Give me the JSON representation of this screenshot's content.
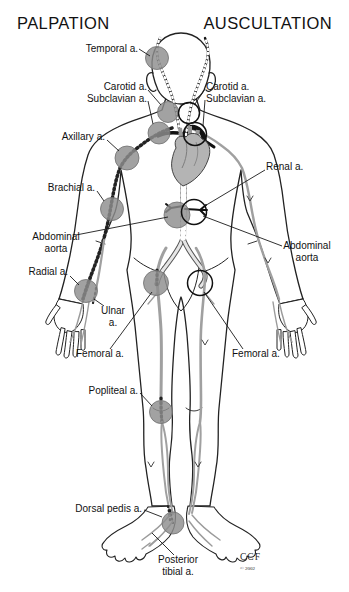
{
  "titles": {
    "left": "PALPATION",
    "right": "AUSCULTATION"
  },
  "labels": {
    "temporal": "Temporal a.",
    "carotid_left": "Carotid a.",
    "subclavian_left": "Subclavian a.",
    "carotid_right": "Carotid a.",
    "subclavian_right": "Subclavian a.",
    "axillary": "Axillary a.",
    "renal": "Renal a.",
    "brachial": "Brachial a.",
    "abdominal_aorta_left": "Abdominal\naorta",
    "abdominal_aorta_right": "Abdominal\naorta",
    "radial": "Radial a.",
    "ulnar": "Ulnar\na.",
    "femoral_left": "Femoral a.",
    "femoral_right": "Femoral a.",
    "popliteal": "Popliteal a.",
    "dorsal_pedis": "Dorsal pedis a.",
    "posterior_tibial": "Posterior\ntibial a."
  },
  "credit": {
    "org": "CCF",
    "year": "© 2002"
  },
  "markers": {
    "palpation_points": [
      "Temporal",
      "Carotid",
      "Subclavian",
      "Axillary",
      "Brachial",
      "Radial",
      "Abdominal aorta",
      "Femoral",
      "Popliteal",
      "Dorsal pedis",
      "Posterior tibial"
    ],
    "auscultation_points": [
      "Carotid",
      "Subclavian",
      "Renal / Abdominal aorta",
      "Femoral"
    ]
  },
  "colors": {
    "background": "#ffffff",
    "palpation_fill": "#8d8d8d",
    "auscultation_ring": "#111111",
    "artery_gray": "#a0a0a0",
    "aorta_black": "#111111",
    "heart_fill": "#b4b4b4",
    "text": "#111111"
  }
}
